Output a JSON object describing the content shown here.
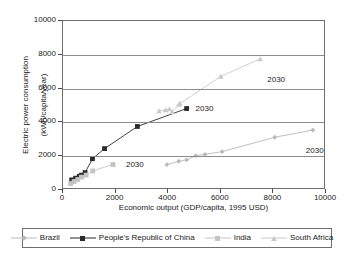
{
  "chart_data": {
    "type": "scatter",
    "title": "",
    "xlabel": "Economic output (GDP/capita, 1995 USD)",
    "ylabel_line1": "Electric power consumption",
    "ylabel_line2": "(kWh/capita/year)",
    "xlim": [
      0,
      10000
    ],
    "ylim": [
      0,
      10000
    ],
    "xticks": [
      "0",
      "2000",
      "4000",
      "6000",
      "8000",
      "10000"
    ],
    "xtick_values": [
      0,
      2000,
      4000,
      6000,
      8000,
      10000
    ],
    "yticks": [
      "0",
      "2000",
      "4000",
      "6000",
      "8000",
      "10000"
    ],
    "ytick_values": [
      0,
      2000,
      4000,
      6000,
      8000,
      10000
    ],
    "grid": "horizontal",
    "legend_position": "below",
    "series": [
      {
        "name": "Brazil",
        "color": "#b9b9b9",
        "marker": "diamond",
        "points": [
          {
            "x": 3950,
            "y": 1500
          },
          {
            "x": 4400,
            "y": 1700
          },
          {
            "x": 4700,
            "y": 1780
          },
          {
            "x": 5050,
            "y": 2030
          },
          {
            "x": 5400,
            "y": 2110
          },
          {
            "x": 6050,
            "y": 2270
          },
          {
            "x": 8050,
            "y": 3120
          },
          {
            "x": 9500,
            "y": 3550
          }
        ],
        "end_label": "2030"
      },
      {
        "name": "People's Republic of China",
        "color": "#2b2b2b",
        "marker": "square",
        "points": [
          {
            "x": 330,
            "y": 600
          },
          {
            "x": 480,
            "y": 700
          },
          {
            "x": 620,
            "y": 810
          },
          {
            "x": 700,
            "y": 880
          },
          {
            "x": 840,
            "y": 1030
          },
          {
            "x": 1120,
            "y": 1850
          },
          {
            "x": 1580,
            "y": 2450
          },
          {
            "x": 2830,
            "y": 3760
          },
          {
            "x": 4700,
            "y": 4820
          }
        ],
        "end_label": "2030"
      },
      {
        "name": "India",
        "color": "#c4c4c4",
        "marker": "square",
        "points": [
          {
            "x": 290,
            "y": 380
          },
          {
            "x": 420,
            "y": 500
          },
          {
            "x": 560,
            "y": 620
          },
          {
            "x": 700,
            "y": 760
          },
          {
            "x": 880,
            "y": 880
          },
          {
            "x": 1130,
            "y": 1130
          },
          {
            "x": 1900,
            "y": 1510
          }
        ],
        "end_label": "2030"
      },
      {
        "name": "South Africa",
        "color": "#c9c9c9",
        "marker": "triangle",
        "points": [
          {
            "x": 3650,
            "y": 4680
          },
          {
            "x": 3900,
            "y": 4740
          },
          {
            "x": 4050,
            "y": 4790
          },
          {
            "x": 4150,
            "y": 4620
          },
          {
            "x": 4400,
            "y": 5060
          },
          {
            "x": 4450,
            "y": 5120
          },
          {
            "x": 6000,
            "y": 6720
          },
          {
            "x": 7500,
            "y": 7760
          }
        ],
        "end_label": "2030"
      }
    ],
    "annotations": [
      {
        "label": "2030",
        "x": 1900,
        "y": 1510,
        "dx": 14,
        "dy": 2
      },
      {
        "label": "2030",
        "x": 4700,
        "y": 4820,
        "dx": 10,
        "dy": 1
      },
      {
        "label": "2030",
        "x": 7500,
        "y": 7760,
        "dx": 8,
        "dy": 22
      },
      {
        "label": "2030",
        "x": 9500,
        "y": 3550,
        "dx": -6,
        "dy": 22
      }
    ]
  }
}
